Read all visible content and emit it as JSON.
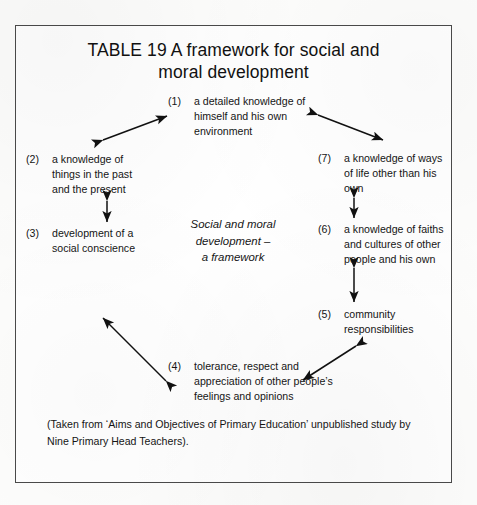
{
  "figure": {
    "title": "TABLE 19 A framework for social and moral development",
    "title_line1": "TABLE 19 A framework for social and",
    "title_line2": "moral development",
    "center_label_line1": "Social and moral",
    "center_label_line2": "development –",
    "center_label_line3": "a framework",
    "caption_line1": "(Taken from ‘Aims and Objectives of Primary Education’ unpublished study by",
    "caption_line2": "Nine Primary  Head Teachers).",
    "border_color": "#4a4a4a",
    "text_color": "#151515",
    "background_color": "#ffffff"
  },
  "nodes": [
    {
      "number": "(1)",
      "text": "a detailed knowledge of himself and his own environment"
    },
    {
      "number": "(2)",
      "text": "a knowledge of things in the past and the present"
    },
    {
      "number": "(3)",
      "text": "development of a social conscience"
    },
    {
      "number": "(4)",
      "text": "tolerance, respect and appreciation of other people’s feelings and opinions"
    },
    {
      "number": "(5)",
      "text": "community responsibilities"
    },
    {
      "number": "(6)",
      "text": "a knowledge of faiths and cultures of other people and his own"
    },
    {
      "number": "(7)",
      "text": "a knowledge of ways of life other than his own"
    }
  ],
  "connections": [
    {
      "from": "(2)",
      "to": "(1)",
      "style": "double-headed"
    },
    {
      "from": "(1)",
      "to": "(7)",
      "style": "double-headed"
    },
    {
      "from": "(7)",
      "to": "(6)",
      "style": "double-headed"
    },
    {
      "from": "(6)",
      "to": "(5)",
      "style": "double-headed"
    },
    {
      "from": "(5)",
      "to": "(4)",
      "style": "double-headed"
    },
    {
      "from": "(4)",
      "to": "(3)",
      "style": "double-headed"
    },
    {
      "from": "(2)",
      "to": "(3)",
      "style": "double-headed"
    }
  ]
}
